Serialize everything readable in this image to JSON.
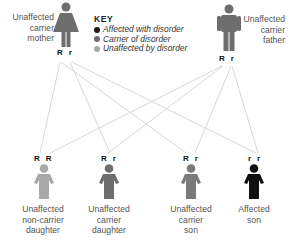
{
  "key": {
    "title": "KEY",
    "items": [
      {
        "label": "Affected with disorder",
        "color": "#1a1a1a"
      },
      {
        "label": "Carrier of disorder",
        "color": "#6e6e6e"
      },
      {
        "label": "Unaffected by disorder",
        "color": "#a8a8a8"
      }
    ]
  },
  "parents": {
    "mother": {
      "label_lines": [
        "Unaffected",
        "carrier",
        "mother"
      ],
      "genotype": "R  r",
      "color": "#6e6e6e"
    },
    "father": {
      "label_lines": [
        "Unaffected",
        "carrier",
        "father"
      ],
      "genotype": "R  r",
      "color": "#6e6e6e"
    }
  },
  "children": [
    {
      "label_lines": [
        "Unaffected",
        "non-carrier",
        "daughter"
      ],
      "genotype": "R  R",
      "color": "#a8a8a8"
    },
    {
      "label_lines": [
        "Unaffected",
        "carrier",
        "daughter"
      ],
      "genotype": "R  r",
      "color": "#6e6e6e"
    },
    {
      "label_lines": [
        "Unaffected",
        "carrier",
        "son"
      ],
      "genotype": "R  r",
      "color": "#7a7a7a"
    },
    {
      "label_lines": [
        "Affected",
        "son"
      ],
      "genotype": "r  r",
      "color": "#111111"
    }
  ],
  "colors": {
    "line": "#d0d0d0",
    "text": "#555555"
  }
}
